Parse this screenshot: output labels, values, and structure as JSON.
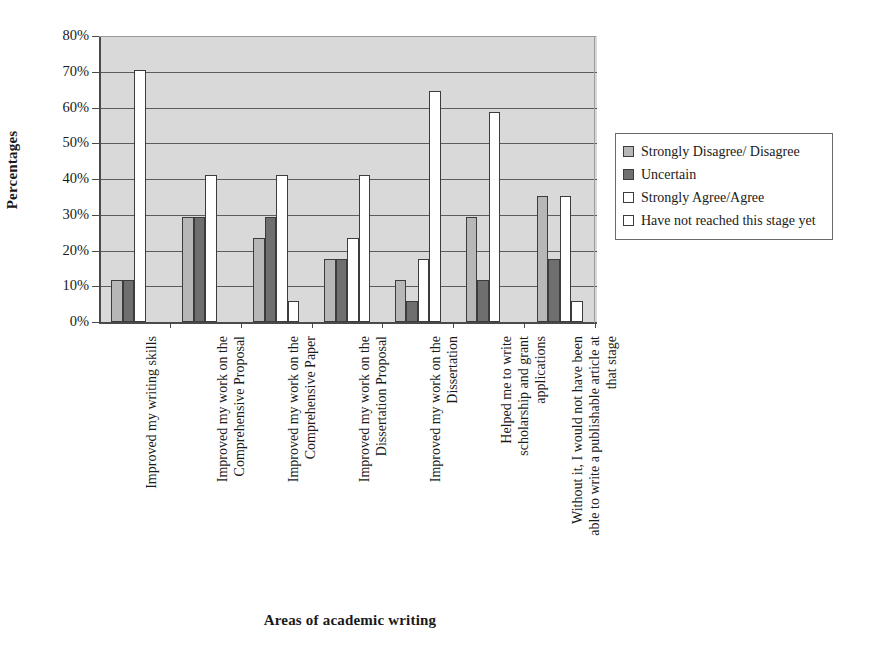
{
  "chart_data": {
    "type": "bar",
    "title": "",
    "xlabel": "Areas of academic writing",
    "ylabel": "Percentages",
    "ylim": [
      0,
      80
    ],
    "yticks": [
      "0%",
      "10%",
      "20%",
      "30%",
      "40%",
      "50%",
      "60%",
      "70%",
      "80%"
    ],
    "ytick_values": [
      0,
      10,
      20,
      30,
      40,
      50,
      60,
      70,
      80
    ],
    "grid": true,
    "legend_position": "right",
    "categories": [
      "Improved my writing skills",
      "Improved my work on the Comprehensive Proposal",
      "Improved my work on the Comprehensive Paper",
      "Improved my work on the Dissertation Proposal",
      "Improved my work on the Dissertation",
      "Helped me to write scholarship and grant applications",
      "Without it, I would not have been able to write a publishable article at that stage"
    ],
    "series": [
      {
        "name": "Strongly Disagree/ Disagree",
        "color": "#b7b7b7",
        "values": [
          11.8,
          29.5,
          23.5,
          17.6,
          11.8,
          29.5,
          35.3
        ]
      },
      {
        "name": "Uncertain",
        "color": "#6f6f6f",
        "values": [
          11.8,
          29.5,
          29.5,
          17.6,
          5.9,
          11.8,
          17.6
        ]
      },
      {
        "name": "Strongly Agree/Agree",
        "color": "#ffffff",
        "values": [
          70.6,
          41.0,
          41.0,
          23.5,
          17.6,
          58.8,
          35.3
        ]
      },
      {
        "name": "Have not reached this stage yet",
        "color": "#ffffff",
        "values": [
          0,
          0,
          5.9,
          41.0,
          64.7,
          0,
          5.9
        ]
      }
    ]
  },
  "legend": {
    "items": [
      {
        "label": "Strongly Disagree/ Disagree"
      },
      {
        "label": "Uncertain"
      },
      {
        "label": "Strongly Agree/Agree"
      },
      {
        "label": "Have not reached this stage yet"
      }
    ]
  },
  "axes": {
    "y_title": "Percentages",
    "x_title": "Areas of academic writing"
  }
}
